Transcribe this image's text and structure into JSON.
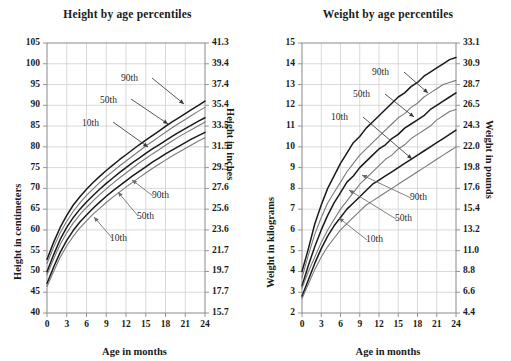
{
  "figure": {
    "background": "#ffffff",
    "boys_color": "#1a1a1a",
    "girls_color": "#7a7a7a",
    "grid_color": "#cfcfcf",
    "frame_color": "#8a8a8a"
  },
  "charts": [
    {
      "id": "height-by-age",
      "title": "Height by age percentiles",
      "xlabel": "Age in months",
      "ylabel_left": "Height in centimeters",
      "ylabel_right": "Height in inches",
      "x_ticks": [
        "0",
        "3",
        "6",
        "9",
        "12",
        "15",
        "18",
        "21",
        "24"
      ],
      "y_ticks_left": [
        "105",
        "100",
        "95",
        "90",
        "85",
        "80",
        "75",
        "70",
        "65",
        "60",
        "55",
        "50",
        "45",
        "40"
      ],
      "y_ticks_right": [
        "41.3",
        "39.4",
        "37.4",
        "35.4",
        "33.5",
        "31.5",
        "29.5",
        "27.6",
        "25.6",
        "23.6",
        "21.7",
        "19.7",
        "17.7",
        "15.7"
      ],
      "annotations_upper": [
        "90th",
        "50th",
        "10th"
      ],
      "annotations_lower": [
        "90th",
        "50th",
        "10th"
      ]
    },
    {
      "id": "weight-by-age",
      "title": "Weight by age percentiles",
      "xlabel": "Age in months",
      "ylabel_left": "Weight in kilograms",
      "ylabel_right": "Weight in pounds",
      "x_ticks": [
        "0",
        "3",
        "6",
        "9",
        "12",
        "15",
        "18",
        "21",
        "24"
      ],
      "y_ticks_left": [
        "15",
        "14",
        "13",
        "12",
        "11",
        "10",
        "9",
        "8",
        "7",
        "6",
        "5",
        "4",
        "3",
        "2"
      ],
      "y_ticks_right": [
        "33.1",
        "30.9",
        "28.7",
        "26.5",
        "24.3",
        "22.0",
        "19.8",
        "17.6",
        "15.4",
        "13.2",
        "11.0",
        "8.8",
        "6.6",
        "4.4"
      ],
      "annotations_upper": [
        "90th",
        "50th",
        "10th"
      ],
      "annotations_lower": [
        "90th",
        "50th",
        "10th"
      ]
    }
  ],
  "chart_data": [
    {
      "type": "line",
      "id": "height-by-age",
      "title": "Height by age percentiles",
      "xlabel": "Age in months",
      "ylabel": "Height in centimeters",
      "ylabel_secondary": "Height in inches",
      "x": [
        0,
        1,
        2,
        3,
        4,
        5,
        6,
        7,
        8,
        9,
        10,
        11,
        12,
        13,
        14,
        15,
        16,
        17,
        18,
        19,
        20,
        21,
        22,
        23,
        24
      ],
      "xlim": [
        0,
        24
      ],
      "ylim": [
        40,
        105
      ],
      "ylim_secondary": [
        15.7,
        41.3
      ],
      "grid": true,
      "legend": "inline-annotations",
      "series": [
        {
          "name": "Boys 90th",
          "group": "boys",
          "percentile": 90,
          "color": "#1a1a1a",
          "values": [
            52.9,
            57.0,
            60.6,
            63.5,
            66.0,
            68.0,
            69.8,
            71.4,
            72.9,
            74.3,
            75.6,
            76.9,
            78.1,
            79.3,
            80.5,
            81.6,
            82.7,
            83.8,
            84.9,
            86.0,
            87.0,
            88.0,
            89.0,
            90.0,
            91.0
          ]
        },
        {
          "name": "Girls 90th",
          "group": "girls",
          "percentile": 90,
          "color": "#7a7a7a",
          "values": [
            51.9,
            55.8,
            59.3,
            62.1,
            64.5,
            66.5,
            68.3,
            69.9,
            71.4,
            72.8,
            74.1,
            75.4,
            76.6,
            77.8,
            79.0,
            80.2,
            81.3,
            82.4,
            83.5,
            84.6,
            85.6,
            86.6,
            87.6,
            88.6,
            89.5
          ]
        },
        {
          "name": "Boys 50th",
          "group": "boys",
          "percentile": 50,
          "color": "#1a1a1a",
          "values": [
            49.9,
            54.0,
            57.7,
            60.6,
            63.0,
            65.0,
            66.7,
            68.3,
            69.8,
            71.2,
            72.5,
            73.8,
            75.0,
            76.2,
            77.3,
            78.4,
            79.5,
            80.5,
            81.5,
            82.5,
            83.5,
            84.4,
            85.3,
            86.2,
            87.0
          ]
        },
        {
          "name": "Girls 50th",
          "group": "girls",
          "percentile": 50,
          "color": "#7a7a7a",
          "values": [
            49.2,
            53.0,
            56.5,
            59.3,
            61.7,
            63.7,
            65.4,
            67.0,
            68.5,
            69.9,
            71.2,
            72.5,
            73.7,
            74.9,
            76.1,
            77.2,
            78.3,
            79.3,
            80.4,
            81.4,
            82.4,
            83.3,
            84.2,
            85.1,
            86.0
          ]
        },
        {
          "name": "Boys 10th",
          "group": "boys",
          "percentile": 10,
          "color": "#1a1a1a",
          "values": [
            47.1,
            51.0,
            54.6,
            57.5,
            59.9,
            61.9,
            63.6,
            65.2,
            66.7,
            68.1,
            69.4,
            70.6,
            71.8,
            73.0,
            74.1,
            75.2,
            76.3,
            77.3,
            78.3,
            79.2,
            80.1,
            81.0,
            81.9,
            82.7,
            83.5
          ]
        },
        {
          "name": "Girls 10th",
          "group": "girls",
          "percentile": 10,
          "color": "#7a7a7a",
          "values": [
            46.4,
            50.0,
            53.4,
            56.2,
            58.5,
            60.5,
            62.2,
            63.8,
            65.2,
            66.6,
            67.9,
            69.1,
            70.3,
            71.5,
            72.6,
            73.7,
            74.8,
            75.8,
            76.8,
            77.8,
            78.7,
            79.6,
            80.5,
            81.4,
            82.2
          ]
        }
      ]
    },
    {
      "type": "line",
      "id": "weight-by-age",
      "title": "Weight by age percentiles",
      "xlabel": "Age in months",
      "ylabel": "Weight in kilograms",
      "ylabel_secondary": "Weight in pounds",
      "x": [
        0,
        1,
        2,
        3,
        4,
        5,
        6,
        7,
        8,
        9,
        10,
        11,
        12,
        13,
        14,
        15,
        16,
        17,
        18,
        19,
        20,
        21,
        22,
        23,
        24
      ],
      "xlim": [
        0,
        24
      ],
      "ylim": [
        2,
        15
      ],
      "ylim_secondary": [
        4.4,
        33.1
      ],
      "grid": true,
      "legend": "inline-annotations",
      "series": [
        {
          "name": "Boys 90th",
          "group": "boys",
          "percentile": 90,
          "color": "#1a1a1a",
          "values": [
            4.0,
            5.1,
            6.3,
            7.2,
            8.0,
            8.6,
            9.2,
            9.7,
            10.2,
            10.5,
            10.9,
            11.2,
            11.5,
            11.8,
            12.1,
            12.4,
            12.6,
            12.9,
            13.1,
            13.4,
            13.6,
            13.8,
            14.0,
            14.2,
            14.3
          ]
        },
        {
          "name": "Girls 90th",
          "group": "girls",
          "percentile": 90,
          "color": "#7a7a7a",
          "values": [
            3.7,
            4.8,
            5.8,
            6.6,
            7.3,
            7.8,
            8.3,
            8.8,
            9.2,
            9.6,
            9.9,
            10.2,
            10.5,
            10.8,
            11.1,
            11.4,
            11.6,
            11.9,
            12.1,
            12.4,
            12.6,
            12.8,
            13.0,
            13.1,
            13.2
          ]
        },
        {
          "name": "Boys 50th",
          "group": "boys",
          "percentile": 50,
          "color": "#1a1a1a",
          "values": [
            3.3,
            4.3,
            5.2,
            6.0,
            6.7,
            7.3,
            7.8,
            8.3,
            8.6,
            9.0,
            9.3,
            9.6,
            9.9,
            10.1,
            10.4,
            10.6,
            10.9,
            11.1,
            11.3,
            11.5,
            11.8,
            12.0,
            12.2,
            12.4,
            12.6
          ]
        },
        {
          "name": "Girls 50th",
          "group": "girls",
          "percentile": 50,
          "color": "#7a7a7a",
          "values": [
            3.2,
            4.0,
            4.7,
            5.4,
            6.0,
            6.5,
            7.0,
            7.4,
            7.8,
            8.2,
            8.5,
            8.8,
            9.1,
            9.4,
            9.6,
            9.9,
            10.1,
            10.4,
            10.6,
            10.8,
            11.0,
            11.3,
            11.5,
            11.7,
            11.8
          ]
        },
        {
          "name": "Boys 10th",
          "group": "boys",
          "percentile": 10,
          "color": "#1a1a1a",
          "values": [
            2.8,
            3.6,
            4.4,
            5.1,
            5.7,
            6.2,
            6.6,
            7.0,
            7.3,
            7.6,
            7.9,
            8.2,
            8.4,
            8.6,
            8.8,
            9.0,
            9.2,
            9.4,
            9.6,
            9.8,
            10.0,
            10.2,
            10.4,
            10.6,
            10.8
          ]
        },
        {
          "name": "Girls 10th",
          "group": "girls",
          "percentile": 10,
          "color": "#7a7a7a",
          "values": [
            2.7,
            3.4,
            4.1,
            4.7,
            5.2,
            5.6,
            6.0,
            6.3,
            6.6,
            6.9,
            7.2,
            7.4,
            7.6,
            7.8,
            8.0,
            8.2,
            8.4,
            8.6,
            8.8,
            9.0,
            9.2,
            9.4,
            9.6,
            9.8,
            10.0
          ]
        }
      ]
    }
  ]
}
